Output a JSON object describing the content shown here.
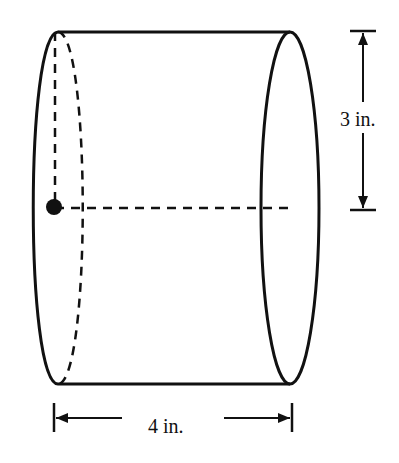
{
  "diagram": {
    "type": "cylinder",
    "orientation": "horizontal",
    "labels": {
      "radius": "3 in.",
      "length": "4 in."
    },
    "colors": {
      "stroke": "#111111",
      "background": "#ffffff"
    }
  }
}
